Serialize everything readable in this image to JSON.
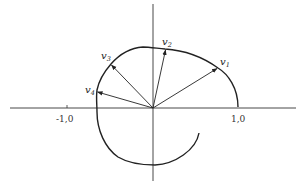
{
  "diagram": {
    "type": "vector-plot-on-spiral-curve",
    "axes": {
      "x_tick_labels": [
        "-1,0",
        "1,0"
      ],
      "x_ticks": [
        -1.0,
        1.0
      ]
    },
    "vectors": [
      {
        "name": "v1",
        "base": "v",
        "subscript": "1"
      },
      {
        "name": "v2",
        "base": "v",
        "subscript": "2"
      },
      {
        "name": "v3",
        "base": "v",
        "subscript": "3"
      },
      {
        "name": "v4",
        "base": "v",
        "subscript": "4"
      }
    ],
    "colors": {
      "stroke": "#222222",
      "background": "#ffffff"
    }
  }
}
